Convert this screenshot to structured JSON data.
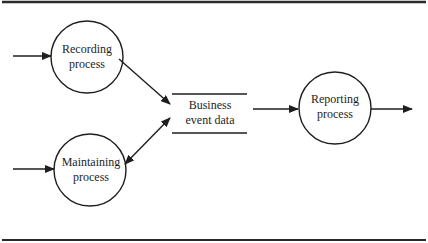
{
  "diagram": {
    "type": "data-flow-diagram",
    "frame": {
      "top_rule_y": 2,
      "bottom_rule_y": 240,
      "color": "#2a2a2a"
    },
    "processes": [
      {
        "id": "recording",
        "line1": "Recording",
        "line2": "process",
        "cx": 87,
        "cy": 57,
        "r": 36
      },
      {
        "id": "maintaining",
        "line1": "Maintaining",
        "line2": "process",
        "cx": 90,
        "cy": 170,
        "r": 36
      },
      {
        "id": "reporting",
        "line1": "Reporting",
        "line2": "process",
        "cx": 335,
        "cy": 108,
        "r": 36
      }
    ],
    "data_store": {
      "id": "business-event-data",
      "line1": "Business",
      "line2": "event data",
      "x1": 172,
      "x2": 247,
      "top_y": 94,
      "bottom_y": 133
    },
    "flows": [
      {
        "from": "external",
        "to": "recording",
        "direction": "one-way"
      },
      {
        "from": "external",
        "to": "maintaining",
        "direction": "one-way"
      },
      {
        "from": "recording",
        "to": "business-event-data",
        "direction": "one-way"
      },
      {
        "from": "maintaining",
        "to": "business-event-data",
        "direction": "two-way"
      },
      {
        "from": "business-event-data",
        "to": "reporting",
        "direction": "one-way"
      },
      {
        "from": "reporting",
        "to": "external",
        "direction": "one-way"
      }
    ],
    "line_color": "#1e1e1e"
  }
}
